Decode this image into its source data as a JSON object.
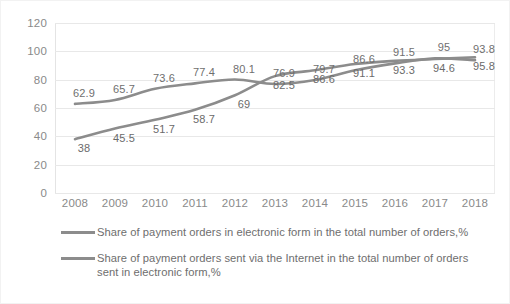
{
  "chart_data": {
    "type": "line",
    "title": "",
    "xlabel": "",
    "ylabel": "",
    "categories": [
      "2008",
      "2009",
      "2010",
      "2011",
      "2012",
      "2013",
      "2014",
      "2015",
      "2016",
      "2017",
      "2018"
    ],
    "ylim": [
      0,
      120
    ],
    "yticks": [
      0,
      20,
      40,
      60,
      80,
      100,
      120
    ],
    "grid": true,
    "legend_position": "bottom",
    "series": [
      {
        "name": "Share of payment orders in electronic form in the total number of orders,%",
        "color": "#8c8c8c",
        "values": [
          62.9,
          65.7,
          73.6,
          77.4,
          80.1,
          76.9,
          79.7,
          86.6,
          91.5,
          95,
          93.8
        ],
        "labels": [
          "62.9",
          "65.7",
          "73.6",
          "77.4",
          "80.1",
          "76.9",
          "79.7",
          "86.6",
          "91.5",
          "95",
          "93.8"
        ]
      },
      {
        "name": "Share of payment orders sent via the Internet in the total number of orders sent in electronic form,%",
        "color": "#8c8c8c",
        "values": [
          38,
          45.5,
          51.7,
          58.7,
          69,
          82.5,
          86.6,
          91.1,
          93.3,
          94.6,
          95.8
        ],
        "labels": [
          "38",
          "45.5",
          "51.7",
          "58.7",
          "69",
          "82.5",
          "86.6",
          "91.1",
          "93.3",
          "94.6",
          "95.8"
        ]
      }
    ]
  },
  "axis": {
    "y_labels": [
      "120",
      "100",
      "80",
      "60",
      "40",
      "20",
      "0"
    ],
    "x_labels": [
      "2008",
      "2009",
      "2010",
      "2011",
      "2012",
      "2013",
      "2014",
      "2015",
      "2016",
      "2017",
      "2018"
    ]
  },
  "legend": {
    "items": [
      {
        "label": "Share of payment orders in electronic form in the total number of orders,%"
      },
      {
        "label": "Share of payment orders sent via the Internet in the total number of orders sent in electronic form,%"
      }
    ]
  },
  "colors": {
    "series_line": "#8c8c8c",
    "gridline": "#e8e8e8",
    "text": "#7b7b7b",
    "frame": "#f2f2f2"
  }
}
